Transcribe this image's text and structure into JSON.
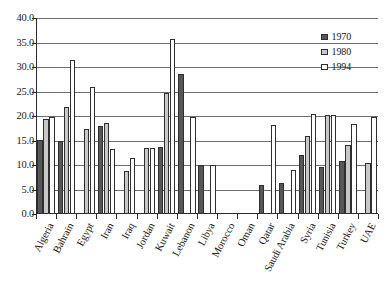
{
  "chart_data": {
    "type": "bar",
    "title": "",
    "subtitle": "",
    "xlabel": "",
    "ylabel": "",
    "ylim": [
      0.0,
      40.0
    ],
    "ytick_step": 5.0,
    "ytick_labels": [
      "40.0",
      "35.0",
      "30.0",
      "25.0",
      "20.0",
      "15.0",
      "10.0",
      "5.0",
      "0.0"
    ],
    "ytick_values": [
      40.0,
      35.0,
      30.0,
      25.0,
      20.0,
      15.0,
      10.0,
      5.0,
      0.0
    ],
    "grid": true,
    "grid_axis": "y",
    "legend_position": "top-right",
    "categories": [
      "Algeria",
      "Bahrain",
      "Egypt",
      "Iran",
      "Iraq",
      "Jordan",
      "Kuwait",
      "Lebanon",
      "Libya",
      "Morocco",
      "Oman",
      "Qatar",
      "Saudi Arabia",
      "Syria",
      "Tunisia",
      "Turkey",
      "UAE"
    ],
    "series": [
      {
        "name": "1970",
        "color": "#575757",
        "values": [
          15.2,
          14.9,
          null,
          18.0,
          null,
          null,
          13.7,
          28.5,
          10.1,
          null,
          null,
          5.9,
          6.4,
          12.0,
          9.6,
          10.9,
          null
        ]
      },
      {
        "name": "1980",
        "color": "#c8c8c8",
        "values": [
          19.3,
          21.8,
          17.3,
          18.6,
          8.7,
          13.4,
          24.6,
          null,
          null,
          null,
          null,
          null,
          null,
          16.0,
          20.2,
          14.0,
          10.4
        ]
      },
      {
        "name": "1994",
        "color": "#ffffff",
        "values": [
          19.9,
          31.4,
          26.0,
          13.2,
          11.5,
          13.4,
          35.8,
          19.8,
          10.0,
          null,
          null,
          18.2,
          8.9,
          20.4,
          20.2,
          18.4,
          19.7
        ]
      }
    ]
  },
  "legend": {
    "items": [
      {
        "label": "1970",
        "swatch_class": "s1970"
      },
      {
        "label": "1980",
        "swatch_class": "s1980"
      },
      {
        "label": "1994",
        "swatch_class": "s1994"
      }
    ]
  },
  "colors": {
    "series_1970": "#575757",
    "series_1980": "#c8c8c8",
    "series_1994": "#ffffff",
    "axis": "#2a2a2a",
    "grid": "#6e6e6e",
    "background": "#ffffff"
  }
}
